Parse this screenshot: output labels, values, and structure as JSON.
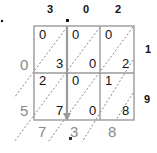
{
  "multiplicand": {
    "digits": [
      "3",
      "0",
      "2"
    ],
    "decimal_after_index": 0
  },
  "multiplier": {
    "digits": [
      "1",
      "9"
    ]
  },
  "cells": [
    [
      {
        "tens": "0",
        "ones": "3"
      },
      {
        "tens": "0",
        "ones": "0"
      },
      {
        "tens": "0",
        "ones": "2"
      }
    ],
    [
      {
        "tens": "2",
        "ones": "7"
      },
      {
        "tens": "0",
        "ones": "0"
      },
      {
        "tens": "1",
        "ones": "8"
      }
    ]
  ],
  "left_sums": [
    "0",
    "5"
  ],
  "bottom_sums": [
    "7",
    ".3",
    "8"
  ],
  "result": "57.38",
  "colors": {
    "grid": "#9a9a9a",
    "arrow": "#9a9a9a",
    "sum_text": "#8a8a8a",
    "text": "#111111"
  }
}
